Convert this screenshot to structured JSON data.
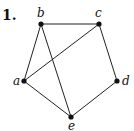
{
  "problem_number": "1.",
  "graph": {
    "vertices": [
      {
        "id": "a",
        "label": "a",
        "x": 24,
        "y": 81,
        "lx": 13,
        "ly": 85
      },
      {
        "id": "b",
        "label": "b",
        "x": 41,
        "y": 24,
        "lx": 37,
        "ly": 17
      },
      {
        "id": "c",
        "label": "c",
        "x": 99,
        "y": 24,
        "lx": 95,
        "ly": 17
      },
      {
        "id": "d",
        "label": "d",
        "x": 117,
        "y": 81,
        "lx": 122,
        "ly": 85
      },
      {
        "id": "e",
        "label": "e",
        "x": 71,
        "y": 117,
        "lx": 68,
        "ly": 130
      }
    ],
    "edges": [
      [
        "b",
        "c"
      ],
      [
        "b",
        "a"
      ],
      [
        "b",
        "e"
      ],
      [
        "c",
        "a"
      ],
      [
        "c",
        "d"
      ],
      [
        "d",
        "e"
      ],
      [
        "a",
        "e"
      ]
    ]
  }
}
